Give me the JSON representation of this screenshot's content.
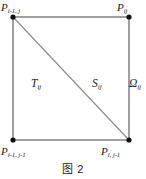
{
  "figure": {
    "caption": "图 2",
    "colors": {
      "background": "#ffffff",
      "square_stroke": "#6e6e6e",
      "diagonal_stroke": "#8a8a8a",
      "vertex_fill": "#111111",
      "text": "#1a1a1a"
    },
    "vertices": [
      {
        "name": "top-left",
        "x": 13,
        "y": 17,
        "label_base": "P",
        "label_sub": "i-1, j"
      },
      {
        "name": "top-right",
        "x": 129,
        "y": 17,
        "label_base": "P",
        "label_sub": "ij"
      },
      {
        "name": "bottom-left",
        "x": 13,
        "y": 140,
        "label_base": "P",
        "label_sub": "i-1, j-1"
      },
      {
        "name": "bottom-right",
        "x": 129,
        "y": 140,
        "label_base": "P",
        "label_sub": "i, j-1"
      }
    ],
    "labels": {
      "top_left_base": "P",
      "top_left_sub": "i-1, j",
      "top_right_base": "P",
      "top_right_sub": "ij",
      "bottom_left_base": "P",
      "bottom_left_sub": "i-1, j-1",
      "bottom_right_base": "P",
      "bottom_right_sub": "i, j-1",
      "triangle_lower_base": "T",
      "triangle_lower_sub": "ij",
      "triangle_upper_base": "S",
      "triangle_upper_sub": "ij",
      "region_base": "Ω",
      "region_sub": "ij"
    },
    "geometry": {
      "square_left": 13,
      "square_top": 17,
      "square_right": 129,
      "square_bottom": 140,
      "diagonal_from": "top-left",
      "diagonal_to": "bottom-right"
    }
  }
}
